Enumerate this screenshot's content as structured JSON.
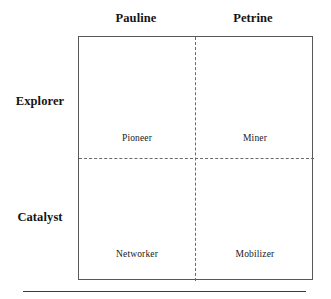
{
  "figure": {
    "type": "two-by-two-matrix",
    "columns": [
      {
        "label": "Pauline"
      },
      {
        "label": "Petrine"
      }
    ],
    "rows": [
      {
        "label": "Explorer"
      },
      {
        "label": "Catalyst"
      }
    ],
    "cells": [
      {
        "label": "Pioneer",
        "row": "Explorer",
        "column": "Pauline"
      },
      {
        "label": "Miner",
        "row": "Explorer",
        "column": "Petrine"
      },
      {
        "label": "Networker",
        "row": "Catalyst",
        "column": "Pauline"
      },
      {
        "label": "Mobilizer",
        "row": "Catalyst",
        "column": "Petrine"
      }
    ],
    "colors": {
      "background": "#ffffff",
      "box_border": "#58585a",
      "divider": "#6a6a6c",
      "rule": "#3a3a3c",
      "header_text": "#141414",
      "cell_text": "#202020"
    }
  }
}
